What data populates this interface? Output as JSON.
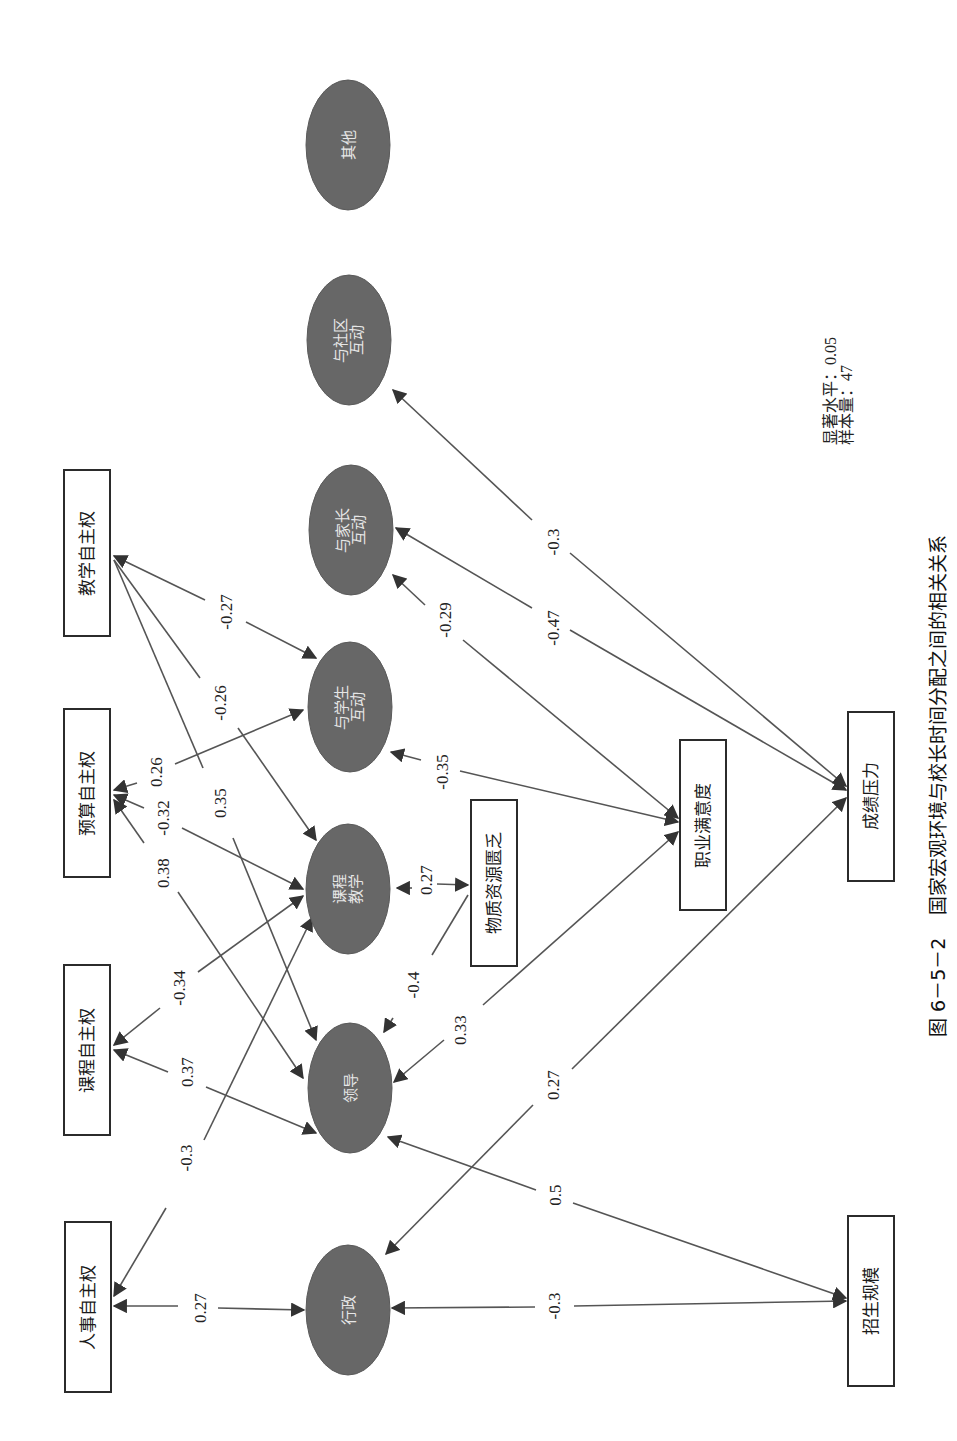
{
  "figure": {
    "caption_number": "图 6－5－2",
    "caption_title": "国家宏观环境与校长时间分配之间的相关关系",
    "note_significance": "显著水平：0.05",
    "note_sample": "样本量：47",
    "orientation": "rotated 90° counter-clockwise"
  },
  "nodes": {
    "jiaoxue": {
      "label": "教学自主权",
      "shape": "box"
    },
    "yusuan": {
      "label": "预算自主权",
      "shape": "box"
    },
    "kecheng_zzq": {
      "label": "课程自主权",
      "shape": "box"
    },
    "renshi": {
      "label": "人事自主权",
      "shape": "box"
    },
    "qita": {
      "label": "其他",
      "shape": "ellipse"
    },
    "shequ": {
      "label1": "与社区",
      "label2": "互动",
      "shape": "ellipse"
    },
    "jiazhang": {
      "label1": "与家长",
      "label2": "互动",
      "shape": "ellipse"
    },
    "xuesheng": {
      "label1": "与学生",
      "label2": "互动",
      "shape": "ellipse"
    },
    "kcjx": {
      "label1": "课程",
      "label2": "教学",
      "shape": "ellipse"
    },
    "lingdao": {
      "label": "领导",
      "shape": "ellipse"
    },
    "xingzheng": {
      "label": "行政",
      "shape": "ellipse"
    },
    "wuzhi": {
      "label": "物质资源匮乏",
      "shape": "box"
    },
    "zhiye": {
      "label": "职业满意度",
      "shape": "box"
    },
    "chengji": {
      "label": "成绩压力",
      "shape": "box"
    },
    "zhaosheng": {
      "label": "招生规模",
      "shape": "box"
    }
  },
  "edges": [
    {
      "from": "教学自主权",
      "to": "与学生互动",
      "weight": "-0.27"
    },
    {
      "from": "教学自主权",
      "to": "课程教学",
      "weight": "-0.26"
    },
    {
      "from": "教学自主权",
      "to": "领导",
      "weight": "0.35"
    },
    {
      "from": "预算自主权",
      "to": "与学生互动",
      "weight": "0.26"
    },
    {
      "from": "预算自主权",
      "to": "课程教学",
      "weight": "-0.32"
    },
    {
      "from": "预算自主权",
      "to": "领导",
      "weight": "0.38"
    },
    {
      "from": "课程自主权",
      "to": "课程教学",
      "weight": "-0.34"
    },
    {
      "from": "课程自主权",
      "to": "招生规模",
      "weight": "0.37"
    },
    {
      "from": "人事自主权",
      "to": "课程教学",
      "weight": "-0.3"
    },
    {
      "from": "人事自主权",
      "to": "行政",
      "weight": "0.27"
    },
    {
      "from": "物质资源匮乏",
      "to": "课程教学",
      "weight": "0.27"
    },
    {
      "from": "物质资源匮乏",
      "to": "领导",
      "weight": "-0.4"
    },
    {
      "from": "职业满意度",
      "to": "领导",
      "weight": "0.33"
    },
    {
      "from": "职业满意度",
      "to": "与学生互动",
      "weight": "-0.35"
    },
    {
      "from": "职业满意度",
      "to": "与家长互动",
      "weight": "-0.29"
    },
    {
      "from": "成绩压力",
      "to": "与家长互动",
      "weight": "-0.47"
    },
    {
      "from": "成绩压力",
      "to": "与社区互动",
      "weight": "-0.3"
    },
    {
      "from": "成绩压力",
      "to": "行政",
      "weight": "0.27"
    },
    {
      "from": "招生规模",
      "to": "领导",
      "weight": "0.5"
    },
    {
      "from": "招生规模",
      "to": "行政",
      "weight": "-0.3"
    }
  ],
  "weights": {
    "e1": "-0.27",
    "e2": "-0.26",
    "e3": "0.35",
    "e4": "0.26",
    "e5": "-0.32",
    "e6": "0.38",
    "e7": "-0.34",
    "e8": "0.37",
    "e9": "-0.3",
    "e10": "0.27",
    "e11": "0.27",
    "e12": "-0.4",
    "e13": "0.33",
    "e14": "-0.35",
    "e15": "-0.29",
    "e16": "-0.47",
    "e17": "-0.3",
    "e18": "0.27",
    "e19": "0.5",
    "e20": "-0.3"
  },
  "colors": {
    "ellipse_fill": "#676767",
    "box_stroke": "#2b2b2b",
    "edge": "#555555"
  }
}
